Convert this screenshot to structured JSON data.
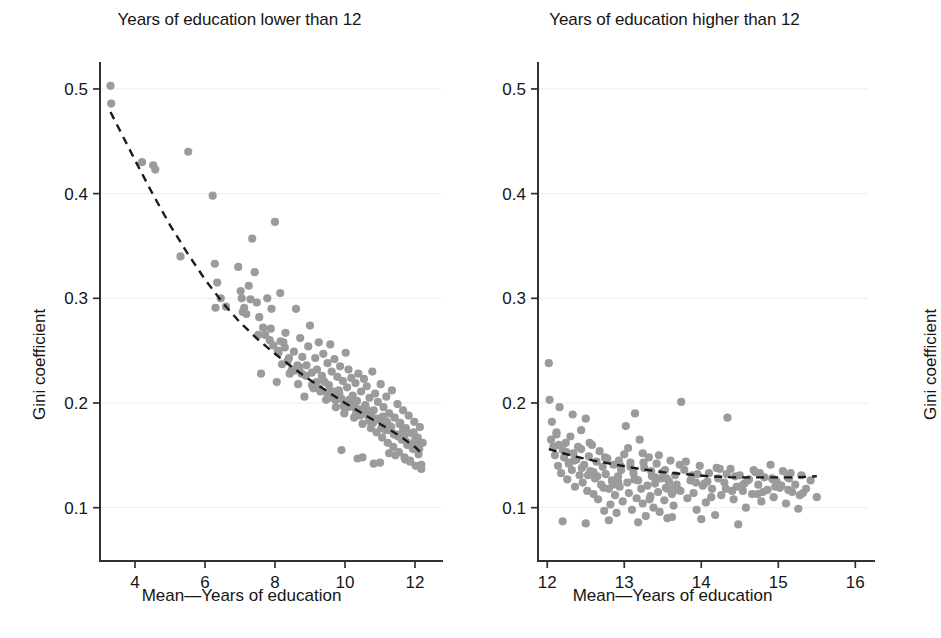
{
  "figure": {
    "background_color": "#ffffff",
    "point_color": "#9b9b9b",
    "trendline_color": "#1b1b1b",
    "axis_color": "#303030",
    "grid_color": "#ededed"
  },
  "panels": [
    {
      "id": "left",
      "title": "Years of education lower than 12",
      "xlabel": "Mean—Years of education",
      "ylabel": "Gini coefficient"
    },
    {
      "id": "right",
      "title": "Years of education higher than 12",
      "xlabel": "Mean—Years of education",
      "ylabel": "Gini coefficient"
    }
  ],
  "chart_data": [
    {
      "type": "scatter",
      "id": "left",
      "title": "Years of education lower than 12",
      "xlabel": "Mean—Years of education",
      "ylabel": "Gini coefficient",
      "xlim": [
        3.0,
        12.6
      ],
      "ylim": [
        0.072,
        0.52
      ],
      "xticks": [
        4,
        6,
        8,
        10,
        12
      ],
      "xticklabels": [
        "4",
        "6",
        "8",
        "10",
        "12"
      ],
      "yticks": [
        0.1,
        0.2,
        0.3,
        0.4,
        0.5
      ],
      "yticklabels": [
        "0.1",
        "0.2",
        "0.3",
        "0.4",
        "0.5"
      ],
      "grid": true,
      "legend": null,
      "series": [
        {
          "name": "countries",
          "marker": "circle",
          "color": "#9b9b9b",
          "x": [
            3.3,
            3.32,
            4.2,
            4.52,
            4.58,
            5.52,
            5.3,
            6.22,
            6.28,
            6.35,
            6.6,
            6.95,
            7.02,
            7.05,
            7.12,
            7.18,
            7.25,
            7.3,
            7.35,
            7.42,
            7.48,
            7.55,
            7.6,
            7.66,
            7.72,
            7.78,
            7.85,
            7.9,
            7.95,
            8.0,
            8.05,
            8.1,
            8.15,
            8.2,
            8.24,
            8.3,
            8.36,
            8.42,
            8.48,
            8.54,
            8.6,
            8.66,
            8.72,
            8.78,
            8.84,
            8.9,
            8.95,
            9.0,
            9.05,
            9.1,
            9.15,
            9.2,
            9.25,
            9.3,
            9.34,
            9.38,
            9.42,
            9.46,
            9.5,
            9.54,
            9.58,
            9.62,
            9.66,
            9.7,
            9.74,
            9.78,
            9.82,
            9.86,
            9.9,
            9.94,
            9.98,
            10.02,
            10.06,
            10.1,
            10.14,
            10.18,
            10.22,
            10.26,
            10.3,
            10.34,
            10.38,
            10.42,
            10.46,
            10.5,
            10.54,
            10.58,
            10.62,
            10.66,
            10.7,
            10.74,
            10.78,
            10.82,
            10.86,
            10.9,
            10.94,
            10.98,
            11.02,
            11.06,
            11.1,
            11.14,
            11.18,
            11.22,
            11.26,
            11.3,
            11.34,
            11.38,
            11.42,
            11.46,
            11.5,
            11.54,
            11.58,
            11.62,
            11.66,
            11.7,
            11.74,
            11.78,
            11.82,
            11.86,
            11.9,
            11.94,
            11.98,
            12.02,
            12.06,
            12.1,
            12.14,
            12.18,
            12.22,
            6.3,
            6.45,
            7.08,
            7.52,
            8.08,
            8.55,
            9.12,
            9.48,
            9.72,
            10.08,
            10.44,
            10.8,
            11.16,
            11.52,
            11.88,
            8.88,
            9.24,
            9.6,
            9.96,
            10.32,
            10.68,
            11.04,
            11.4,
            11.76,
            12.12,
            9.36,
            9.84,
            10.2,
            10.56,
            10.92,
            11.28,
            11.64,
            12.0,
            8.4,
            8.64,
            9.06,
            9.56,
            10.0,
            10.4,
            10.86,
            11.32,
            11.7,
            12.05,
            7.88,
            8.28,
            8.7,
            9.18,
            9.66,
            10.12,
            10.6,
            11.08,
            11.56,
            11.96,
            8.16,
            8.76,
            9.28,
            9.78,
            10.26,
            10.74,
            11.2,
            11.66,
            12.08,
            10.5,
            11.0,
            11.44,
            11.86,
            12.16,
            9.9,
            10.36,
            10.82,
            11.26,
            11.72,
            12.18
          ],
          "y": [
            0.503,
            0.486,
            0.43,
            0.427,
            0.423,
            0.44,
            0.34,
            0.398,
            0.333,
            0.315,
            0.292,
            0.33,
            0.307,
            0.3,
            0.291,
            0.285,
            0.312,
            0.299,
            0.357,
            0.325,
            0.296,
            0.282,
            0.228,
            0.272,
            0.265,
            0.3,
            0.26,
            0.29,
            0.255,
            0.373,
            0.22,
            0.248,
            0.305,
            0.237,
            0.258,
            0.267,
            0.24,
            0.228,
            0.232,
            0.249,
            0.29,
            0.218,
            0.262,
            0.244,
            0.206,
            0.236,
            0.254,
            0.274,
            0.229,
            0.214,
            0.243,
            0.232,
            0.258,
            0.211,
            0.226,
            0.247,
            0.22,
            0.203,
            0.238,
            0.217,
            0.256,
            0.23,
            0.208,
            0.242,
            0.196,
            0.225,
            0.212,
            0.235,
            0.204,
            0.221,
            0.19,
            0.248,
            0.215,
            0.232,
            0.199,
            0.224,
            0.207,
            0.186,
            0.219,
            0.202,
            0.228,
            0.194,
            0.211,
            0.18,
            0.223,
            0.198,
            0.216,
            0.188,
            0.205,
            0.176,
            0.23,
            0.193,
            0.209,
            0.172,
            0.201,
            0.184,
            0.218,
            0.167,
            0.196,
            0.179,
            0.206,
            0.162,
            0.19,
            0.174,
            0.212,
            0.158,
            0.186,
            0.17,
            0.199,
            0.153,
            0.181,
            0.165,
            0.193,
            0.148,
            0.176,
            0.16,
            0.188,
            0.144,
            0.171,
            0.156,
            0.182,
            0.14,
            0.166,
            0.151,
            0.177,
            0.137,
            0.162,
            0.291,
            0.3,
            0.287,
            0.265,
            0.25,
            0.231,
            0.218,
            0.21,
            0.203,
            0.196,
            0.188,
            0.181,
            0.174,
            0.168,
            0.16,
            0.226,
            0.214,
            0.205,
            0.197,
            0.19,
            0.183,
            0.176,
            0.17,
            0.163,
            0.156,
            0.222,
            0.209,
            0.2,
            0.192,
            0.185,
            0.178,
            0.171,
            0.164,
            0.243,
            0.236,
            0.217,
            0.206,
            0.198,
            0.191,
            0.184,
            0.177,
            0.169,
            0.161,
            0.271,
            0.253,
            0.234,
            0.22,
            0.211,
            0.203,
            0.195,
            0.187,
            0.18,
            0.172,
            0.259,
            0.228,
            0.213,
            0.204,
            0.196,
            0.189,
            0.182,
            0.175,
            0.167,
            0.148,
            0.143,
            0.15,
            0.145,
            0.139,
            0.155,
            0.147,
            0.142,
            0.152,
            0.146,
            0.141
          ]
        }
      ],
      "trendline": {
        "style": "dashed",
        "color": "#1b1b1b",
        "points": [
          [
            3.3,
            0.478
          ],
          [
            4.0,
            0.432
          ],
          [
            4.5,
            0.4
          ],
          [
            5.0,
            0.37
          ],
          [
            5.5,
            0.343
          ],
          [
            6.0,
            0.318
          ],
          [
            6.5,
            0.296
          ],
          [
            7.0,
            0.277
          ],
          [
            7.5,
            0.261
          ],
          [
            8.0,
            0.247
          ],
          [
            8.5,
            0.234
          ],
          [
            9.0,
            0.222
          ],
          [
            9.5,
            0.211
          ],
          [
            10.0,
            0.2
          ],
          [
            10.5,
            0.19
          ],
          [
            11.0,
            0.18
          ],
          [
            11.5,
            0.17
          ],
          [
            12.0,
            0.158
          ],
          [
            12.25,
            0.15
          ]
        ]
      }
    },
    {
      "type": "scatter",
      "id": "right",
      "title": "Years of education higher than 12",
      "xlabel": "Mean—Years of education",
      "ylabel": "Gini coefficient",
      "xlim": [
        11.88,
        16.1
      ],
      "ylim": [
        0.072,
        0.52
      ],
      "xticks": [
        12,
        13,
        14,
        15,
        16
      ],
      "xticklabels": [
        "12",
        "13",
        "14",
        "15",
        "16"
      ],
      "yticks": [
        0.1,
        0.2,
        0.3,
        0.4,
        0.5
      ],
      "yticklabels": [
        "0.1",
        "0.2",
        "0.3",
        "0.4",
        "0.5"
      ],
      "grid": true,
      "legend": null,
      "series": [
        {
          "name": "countries",
          "marker": "circle",
          "color": "#9b9b9b",
          "x": [
            12.02,
            12.03,
            12.05,
            12.08,
            12.1,
            12.12,
            12.14,
            12.16,
            12.18,
            12.2,
            12.22,
            12.24,
            12.26,
            12.28,
            12.3,
            12.32,
            12.34,
            12.36,
            12.38,
            12.4,
            12.42,
            12.44,
            12.46,
            12.48,
            12.5,
            12.52,
            12.54,
            12.56,
            12.58,
            12.6,
            12.62,
            12.64,
            12.66,
            12.68,
            12.7,
            12.72,
            12.74,
            12.76,
            12.78,
            12.8,
            12.82,
            12.84,
            12.86,
            12.88,
            12.9,
            12.92,
            12.94,
            12.96,
            12.98,
            13.0,
            13.02,
            13.04,
            13.06,
            13.08,
            13.1,
            13.12,
            13.14,
            13.16,
            13.18,
            13.2,
            13.22,
            13.24,
            13.26,
            13.28,
            13.3,
            13.32,
            13.34,
            13.36,
            13.38,
            13.4,
            13.42,
            13.44,
            13.46,
            13.48,
            13.5,
            13.52,
            13.54,
            13.56,
            13.58,
            13.6,
            13.62,
            13.64,
            13.66,
            13.68,
            13.7,
            13.74,
            13.78,
            13.82,
            13.86,
            13.9,
            13.94,
            13.98,
            14.02,
            14.06,
            14.1,
            14.14,
            14.18,
            14.22,
            14.26,
            14.3,
            14.34,
            14.38,
            14.42,
            14.46,
            14.5,
            14.54,
            14.58,
            14.62,
            14.66,
            14.7,
            14.74,
            14.78,
            14.82,
            14.86,
            14.9,
            14.94,
            14.98,
            15.02,
            15.06,
            15.1,
            15.14,
            15.18,
            15.22,
            15.26,
            15.3,
            15.36,
            15.42,
            15.5,
            12.06,
            12.15,
            12.25,
            12.35,
            12.45,
            12.55,
            12.65,
            12.75,
            12.85,
            12.95,
            13.05,
            13.15,
            13.25,
            13.35,
            13.45,
            13.55,
            13.65,
            13.8,
            13.95,
            14.08,
            14.2,
            14.32,
            14.44,
            14.56,
            14.68,
            14.8,
            14.92,
            15.04,
            15.16,
            15.28,
            12.12,
            12.28,
            12.44,
            12.6,
            12.76,
            12.92,
            13.08,
            13.24,
            13.4,
            13.56,
            13.72,
            13.88,
            14.04,
            14.24,
            14.4,
            14.6,
            14.76,
            14.96,
            15.12,
            15.32,
            12.33,
            12.53,
            12.73,
            12.93,
            13.13,
            13.33,
            13.53,
            13.73,
            13.93,
            14.13,
            14.33,
            14.53,
            14.73,
            14.93,
            15.13,
            12.2,
            12.5,
            12.8,
            13.18,
            13.62,
            14.0,
            14.48
          ],
          "y": [
            0.238,
            0.203,
            0.165,
            0.158,
            0.15,
            0.172,
            0.14,
            0.196,
            0.133,
            0.155,
            0.148,
            0.162,
            0.127,
            0.143,
            0.168,
            0.136,
            0.152,
            0.12,
            0.146,
            0.158,
            0.131,
            0.174,
            0.124,
            0.141,
            0.185,
            0.116,
            0.149,
            0.135,
            0.16,
            0.113,
            0.128,
            0.144,
            0.108,
            0.154,
            0.122,
            0.139,
            0.097,
            0.132,
            0.147,
            0.118,
            0.103,
            0.126,
            0.141,
            0.112,
            0.095,
            0.13,
            0.12,
            0.136,
            0.106,
            0.151,
            0.178,
            0.124,
            0.114,
            0.143,
            0.098,
            0.133,
            0.19,
            0.109,
            0.126,
            0.165,
            0.118,
            0.104,
            0.138,
            0.092,
            0.121,
            0.148,
            0.111,
            0.13,
            0.1,
            0.123,
            0.142,
            0.115,
            0.096,
            0.128,
            0.134,
            0.107,
            0.119,
            0.09,
            0.125,
            0.145,
            0.113,
            0.102,
            0.131,
            0.122,
            0.117,
            0.201,
            0.136,
            0.109,
            0.126,
            0.114,
            0.098,
            0.14,
            0.121,
            0.105,
            0.133,
            0.118,
            0.093,
            0.128,
            0.112,
            0.124,
            0.186,
            0.137,
            0.108,
            0.12,
            0.131,
            0.116,
            0.1,
            0.127,
            0.113,
            0.134,
            0.122,
            0.106,
            0.129,
            0.117,
            0.141,
            0.11,
            0.125,
            0.119,
            0.135,
            0.104,
            0.128,
            0.115,
            0.122,
            0.099,
            0.131,
            0.118,
            0.126,
            0.11,
            0.182,
            0.16,
            0.153,
            0.145,
            0.138,
            0.162,
            0.13,
            0.148,
            0.122,
            0.14,
            0.157,
            0.127,
            0.143,
            0.135,
            0.15,
            0.128,
            0.12,
            0.144,
            0.132,
            0.125,
            0.138,
            0.118,
            0.13,
            0.123,
            0.136,
            0.115,
            0.128,
            0.121,
            0.133,
            0.112,
            0.17,
            0.142,
            0.156,
            0.134,
            0.147,
            0.125,
            0.139,
            0.152,
            0.129,
            0.118,
            0.141,
            0.131,
            0.123,
            0.137,
            0.116,
            0.126,
            0.133,
            0.12,
            0.129,
            0.114,
            0.189,
            0.131,
            0.119,
            0.145,
            0.127,
            0.108,
            0.136,
            0.116,
            0.124,
            0.11,
            0.132,
            0.121,
            0.113,
            0.127,
            0.117,
            0.087,
            0.085,
            0.088,
            0.086,
            0.091,
            0.089,
            0.084
          ]
        }
      ],
      "trendline": {
        "style": "dashed",
        "color": "#1b1b1b",
        "points": [
          [
            12.02,
            0.156
          ],
          [
            12.3,
            0.15
          ],
          [
            12.6,
            0.145
          ],
          [
            12.9,
            0.141
          ],
          [
            13.2,
            0.137
          ],
          [
            13.5,
            0.134
          ],
          [
            13.8,
            0.132
          ],
          [
            14.1,
            0.13
          ],
          [
            14.4,
            0.129
          ],
          [
            14.7,
            0.129
          ],
          [
            15.0,
            0.129
          ],
          [
            15.25,
            0.129
          ],
          [
            15.5,
            0.13
          ]
        ]
      }
    }
  ]
}
